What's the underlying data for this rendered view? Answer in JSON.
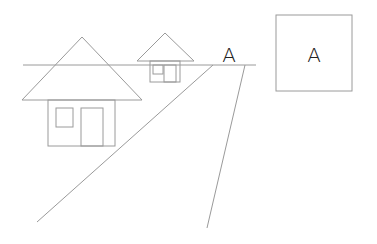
{
  "scene": {
    "description": "Perspective drawing with horizon line, two houses and a road converging toward a vanishing point labeled A",
    "stroke_color": "#9a9a9a",
    "text_color": "#222222"
  },
  "labels": {
    "vanishing_point": "A",
    "box_label": "A"
  }
}
